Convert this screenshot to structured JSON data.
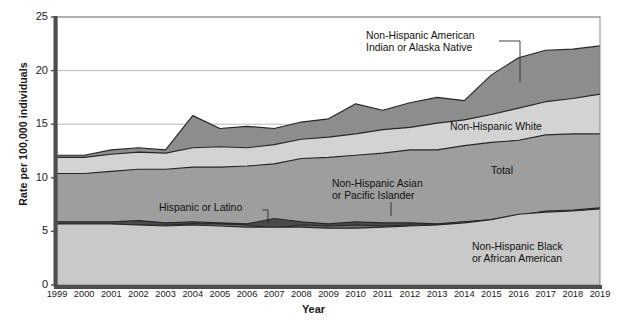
{
  "figure": {
    "axis_titles": {
      "y": "Rate per 100,000 individuals",
      "x": "Year"
    }
  },
  "chart_data": {
    "type": "area",
    "title": "",
    "subtitle": "",
    "xlabel": "Year",
    "ylabel": "Rate per 100,000 individuals",
    "grid": true,
    "grid_axis": "y",
    "legend_position": "inline-annotations",
    "xlim": [
      1999,
      2019
    ],
    "ylim": [
      0,
      25
    ],
    "yticks": [
      0,
      5,
      10,
      15,
      20,
      25
    ],
    "x": [
      1999,
      2000,
      2001,
      2002,
      2003,
      2004,
      2005,
      2006,
      2007,
      2008,
      2009,
      2010,
      2011,
      2012,
      2013,
      2014,
      2015,
      2016,
      2017,
      2018,
      2019
    ],
    "categories": [
      "1999",
      "2000",
      "2001",
      "2002",
      "2003",
      "2004",
      "2005",
      "2006",
      "2007",
      "2008",
      "2009",
      "2010",
      "2011",
      "2012",
      "2013",
      "2014",
      "2015",
      "2016",
      "2017",
      "2018",
      "2019"
    ],
    "stacking": "overlaid-lines",
    "series": [
      {
        "name": "Non-Hispanic American Indian or Alaska Native",
        "color": "#8d8d8d",
        "values": [
          12.1,
          12.1,
          12.6,
          12.8,
          12.6,
          15.8,
          14.6,
          14.8,
          14.6,
          15.2,
          15.5,
          16.9,
          16.3,
          17.0,
          17.5,
          17.2,
          19.6,
          21.2,
          21.9,
          22.0,
          22.3
        ]
      },
      {
        "name": "Non-Hispanic White",
        "color": "#d3d3d3",
        "values": [
          11.9,
          11.9,
          12.2,
          12.4,
          12.3,
          12.8,
          12.9,
          12.8,
          13.1,
          13.6,
          13.8,
          14.1,
          14.5,
          14.7,
          15.1,
          15.4,
          15.9,
          16.5,
          17.1,
          17.4,
          17.8
        ]
      },
      {
        "name": "Total",
        "color": "#9e9e9e",
        "values": [
          10.4,
          10.4,
          10.6,
          10.8,
          10.8,
          11.0,
          11.0,
          11.1,
          11.3,
          11.8,
          11.9,
          12.1,
          12.3,
          12.6,
          12.6,
          13.0,
          13.3,
          13.5,
          14.0,
          14.1,
          14.1
        ]
      },
      {
        "name": "Hispanic or Latino",
        "color": "#4a4a4a",
        "values": [
          5.9,
          5.9,
          5.9,
          6.0,
          5.8,
          5.9,
          5.8,
          5.7,
          6.2,
          5.9,
          5.7,
          5.9,
          5.8,
          5.8,
          5.7,
          5.9,
          6.1,
          6.5,
          6.9,
          7.0,
          7.2
        ]
      },
      {
        "name": "Non-Hispanic Asian or Pacific Islander",
        "color": "#6e6e6e",
        "values": [
          5.6,
          5.6,
          5.6,
          5.6,
          5.6,
          5.7,
          5.7,
          5.6,
          5.3,
          5.6,
          5.5,
          5.6,
          5.5,
          5.6,
          5.6,
          5.9,
          6.0,
          6.3,
          6.6,
          6.8,
          6.9
        ]
      },
      {
        "name": "Non-Hispanic Black or African American",
        "color": "#c9c9c9",
        "values": [
          5.7,
          5.7,
          5.7,
          5.6,
          5.5,
          5.6,
          5.5,
          5.4,
          5.4,
          5.4,
          5.3,
          5.3,
          5.4,
          5.5,
          5.6,
          5.8,
          6.1,
          6.6,
          6.8,
          6.9,
          7.1
        ]
      }
    ],
    "annotations": [
      {
        "text_line1": "Non-Hispanic American",
        "text_line2": "Indian or Alaska Native",
        "x": 1999,
        "y": 23
      },
      {
        "text_line1": "Non-Hispanic White",
        "text_line2": "",
        "x": 2015,
        "y": 16.5
      },
      {
        "text_line1": "Total",
        "text_line2": "",
        "x": 2015,
        "y": 12
      },
      {
        "text_line1": "Non-Hispanic Asian",
        "text_line2": "or Pacific Islander",
        "x": 2011,
        "y": 8.5
      },
      {
        "text_line1": "Hispanic or Latino",
        "text_line2": "",
        "x": 2004,
        "y": 7.3
      },
      {
        "text_line1": "Non-Hispanic Black",
        "text_line2": "or African American",
        "x": 2016,
        "y": 3.5
      }
    ]
  },
  "yticklabels": [
    "0",
    "5",
    "10",
    "15",
    "20",
    "25"
  ],
  "xticklabels": [
    "1999",
    "2000",
    "2001",
    "2002",
    "2003",
    "2004",
    "2005",
    "2006",
    "2007",
    "2008",
    "2009",
    "2010",
    "2011",
    "2012",
    "2013",
    "2014",
    "2015",
    "2016",
    "2017",
    "2018",
    "2019"
  ],
  "annotation_labels": {
    "aian_1": "Non-Hispanic American",
    "aian_2": "Indian or Alaska Native",
    "white": "Non-Hispanic White",
    "total": "Total",
    "asian_1": "Non-Hispanic Asian",
    "asian_2": "or Pacific Islander",
    "hispanic": "Hispanic or Latino",
    "black_1": "Non-Hispanic Black",
    "black_2": "or African American"
  }
}
